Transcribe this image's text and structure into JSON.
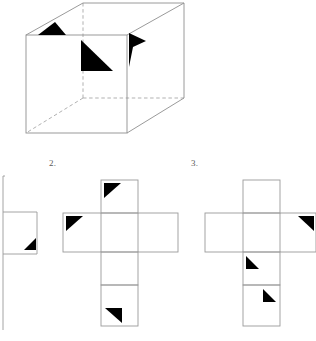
{
  "page": {
    "width": 316,
    "height": 341,
    "background_color": "#ffffff"
  },
  "colors": {
    "stroke": "#9a9a9a",
    "stroke_dark": "#808080",
    "marker_fill": "#000000",
    "label_text": "#5a5a5a",
    "background": "#ffffff"
  },
  "labels": [
    {
      "id": "label-2",
      "text": "2.",
      "x": 49,
      "y": 159
    },
    {
      "id": "label-3",
      "text": "3.",
      "x": 191,
      "y": 159
    }
  ],
  "cube": {
    "name": "transparent-rectangular-box",
    "front_face": {
      "x": 26,
      "y": 35,
      "width": 101,
      "height": 98
    },
    "vertices": {
      "front_top_left": [
        26,
        35
      ],
      "front_top_right": [
        127,
        35
      ],
      "front_bottom_left": [
        26,
        133
      ],
      "front_bottom_right": [
        127,
        133
      ],
      "back_top_left": [
        83,
        3
      ],
      "back_top_right": [
        184,
        3
      ],
      "back_bottom_left": [
        83,
        98
      ],
      "back_bottom_right": [
        184,
        98
      ]
    },
    "hidden_edges": [
      "back_top_left-back_bottom_left",
      "back_bottom_left-back_bottom_right",
      "back_bottom_left-front_bottom_left"
    ],
    "markers": [
      {
        "name": "marker-top-face",
        "points": "38,35 55,22 66,35",
        "face": "top"
      },
      {
        "name": "marker-back-face",
        "points": "81,40 81,71 113,71",
        "face": "back-inner"
      },
      {
        "name": "marker-right-face",
        "points": "129,67 129,33 146,40",
        "face": "right"
      }
    ]
  },
  "nets": [
    {
      "name": "net-option-1",
      "note": "partially cropped at left page edge",
      "squares": [
        {
          "x": 3,
          "y": 178,
          "w": 34,
          "h": 34,
          "visible_edges": "partial"
        },
        {
          "x": 3,
          "y": 212,
          "w": 34,
          "h": 42,
          "visible_edges": "full"
        },
        {
          "x": 3,
          "y": 254,
          "w": 34,
          "h": 34,
          "visible_edges": "partial"
        },
        {
          "x": 3,
          "y": 288,
          "w": 34,
          "h": 40,
          "visible_edges": "partial"
        }
      ],
      "markers": [
        {
          "name": "marker-net1-bottom-right",
          "points": "24,249 35,249 35,238"
        }
      ]
    },
    {
      "name": "net-option-2",
      "squares": [
        {
          "x": 101,
          "y": 180,
          "w": 37,
          "h": 33
        },
        {
          "x": 63,
          "y": 213,
          "w": 38,
          "h": 39
        },
        {
          "x": 101,
          "y": 213,
          "w": 37,
          "h": 39
        },
        {
          "x": 138,
          "y": 213,
          "w": 40,
          "h": 39
        },
        {
          "x": 101,
          "y": 252,
          "w": 37,
          "h": 33
        },
        {
          "x": 101,
          "y": 285,
          "w": 37,
          "h": 41
        }
      ],
      "markers": [
        {
          "name": "marker-net2-top-square",
          "points": "104,183 121,183 104,198"
        },
        {
          "name": "marker-net2-left-square",
          "points": "66,216 82,216 66,231"
        },
        {
          "name": "marker-net2-bottom-square",
          "points": "105,308 122,308 122,322"
        }
      ]
    },
    {
      "name": "net-option-3",
      "squares": [
        {
          "x": 243,
          "y": 180,
          "w": 37,
          "h": 33
        },
        {
          "x": 205,
          "y": 213,
          "w": 38,
          "h": 39
        },
        {
          "x": 243,
          "y": 213,
          "w": 37,
          "h": 39
        },
        {
          "x": 280,
          "y": 213,
          "w": 36,
          "h": 39
        },
        {
          "x": 243,
          "y": 252,
          "w": 37,
          "h": 33
        },
        {
          "x": 243,
          "y": 285,
          "w": 37,
          "h": 41
        }
      ],
      "markers": [
        {
          "name": "marker-net3-right-square",
          "points": "297,216 313,216 313,231"
        },
        {
          "name": "marker-net3-center-lower",
          "points": "246,255 246,268 259,268"
        },
        {
          "name": "marker-net3-bottom-square",
          "points": "262,288 262,301 275,301"
        }
      ]
    }
  ]
}
